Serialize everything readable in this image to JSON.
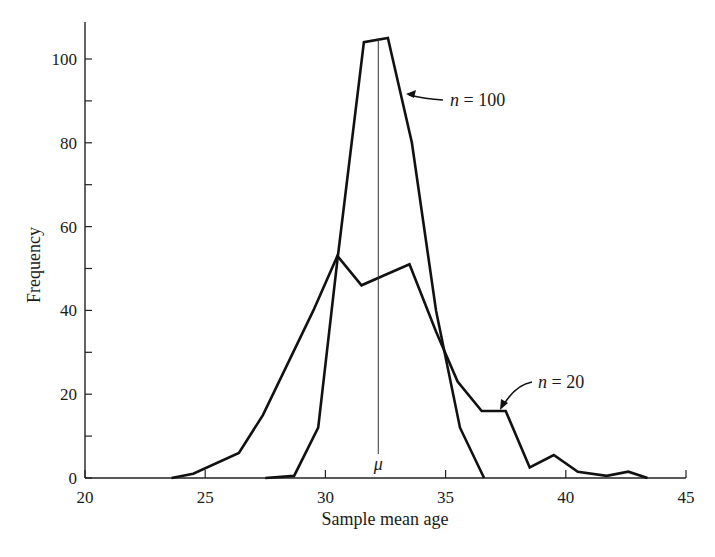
{
  "chart_data": {
    "type": "line",
    "title": "",
    "xlabel": "Sample mean age",
    "ylabel": "Frequency",
    "xlim": [
      20,
      45
    ],
    "ylim": [
      0,
      110
    ],
    "xticks": [
      20,
      25,
      30,
      35,
      40,
      45
    ],
    "yticks": [
      0,
      20,
      40,
      60,
      80,
      100
    ],
    "y_minor_ticks": [
      10,
      30,
      50,
      70,
      90
    ],
    "grid": false,
    "legend": "none (inline annotations)",
    "series": [
      {
        "name": "n = 100",
        "points": [
          [
            27.5,
            0
          ],
          [
            28.7,
            0.5
          ],
          [
            29.7,
            12
          ],
          [
            30.5,
            52
          ],
          [
            31.6,
            104
          ],
          [
            32.6,
            105
          ],
          [
            33.6,
            80
          ],
          [
            34.6,
            40
          ],
          [
            35.6,
            12
          ],
          [
            36.6,
            0
          ]
        ]
      },
      {
        "name": "n = 20",
        "points": [
          [
            23.6,
            0
          ],
          [
            24.5,
            1
          ],
          [
            26.4,
            6
          ],
          [
            27.4,
            15
          ],
          [
            29.5,
            40
          ],
          [
            30.5,
            53
          ],
          [
            31.5,
            46
          ],
          [
            32.5,
            48.5
          ],
          [
            33.5,
            51
          ],
          [
            34.6,
            35
          ],
          [
            35.5,
            23
          ],
          [
            36.5,
            16
          ],
          [
            37.5,
            16
          ],
          [
            38.5,
            2.5
          ],
          [
            39.5,
            5.5
          ],
          [
            40.5,
            1.5
          ],
          [
            41.7,
            0.5
          ],
          [
            42.6,
            1.5
          ],
          [
            43.4,
            0
          ]
        ]
      }
    ],
    "annotations": [
      {
        "text": "n = 100",
        "points_to": "n = 100 curve near x=33.5, y=88"
      },
      {
        "text": "n = 20",
        "points_to": "n = 20 curve near x=37, y=16"
      },
      {
        "text": "μ",
        "vertical_line_at_x": 32.2,
        "from_y": 0,
        "to_y": 105
      }
    ]
  },
  "labels": {
    "xlabel": "Sample mean age",
    "ylabel": "Frequency",
    "n100": "n = 100",
    "n20": "n = 20",
    "mu": "μ"
  }
}
